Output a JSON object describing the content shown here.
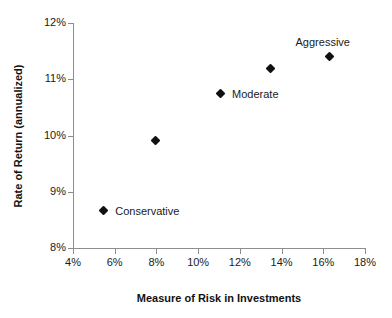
{
  "chart_data": {
    "type": "scatter",
    "title": "",
    "xlabel": "Measure of Risk in Investments",
    "ylabel": "Rate of Return (annualized)",
    "xlim": [
      4,
      18
    ],
    "ylim": [
      8,
      12
    ],
    "grid": false,
    "legend": "none",
    "x_tick_labels": [
      "4%",
      "6%",
      "8%",
      "10%",
      "12%",
      "14%",
      "16%",
      "18%"
    ],
    "x_ticks": [
      4,
      6,
      8,
      10,
      12,
      14,
      16,
      18
    ],
    "y_tick_labels": [
      "8%",
      "9%",
      "10%",
      "11%",
      "12%"
    ],
    "y_ticks": [
      8,
      9,
      10,
      11,
      12
    ],
    "marker": "diamond",
    "marker_color": "#111111",
    "axis_color": "#8d8d8d",
    "points": [
      {
        "x": 5.45,
        "y": 8.67,
        "label": "Conservative",
        "label_position": "right"
      },
      {
        "x": 7.95,
        "y": 9.92,
        "label": "",
        "label_position": "none"
      },
      {
        "x": 11.05,
        "y": 10.75,
        "label": "Moderate",
        "label_position": "right"
      },
      {
        "x": 13.45,
        "y": 11.2,
        "label": "",
        "label_position": "none"
      },
      {
        "x": 16.3,
        "y": 11.4,
        "label": "Aggressive",
        "label_position": "above"
      }
    ]
  }
}
